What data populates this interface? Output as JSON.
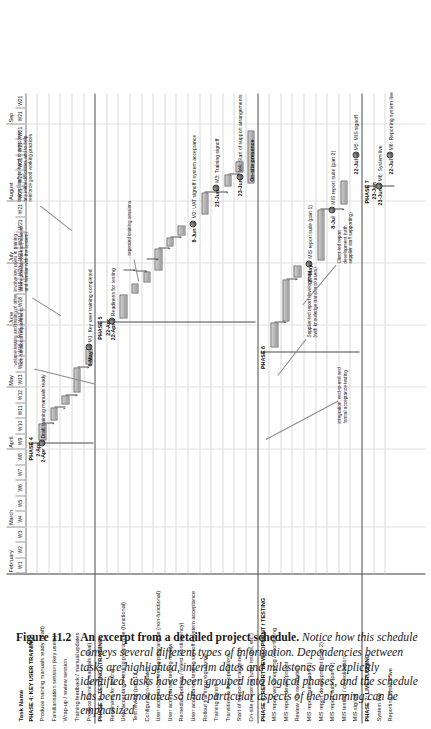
{
  "figure": {
    "number": "Figure 11.2",
    "title": "An excerpt from a detailed project schedule.",
    "body": "Notice how this schedule conveys several different types of information. Dependencies between tasks are highlighted, interim dates and milestones are explicitly identified, tasks have been grouped into logical phases, and the schedule has been annotated so that particular aspects of the planning can be emphasized"
  },
  "chart_data": {
    "type": "gantt",
    "title": "Detailed project schedule",
    "task_column_header": "Task Name",
    "months": [
      {
        "label": "February",
        "weeks": 3
      },
      {
        "label": "March",
        "weeks": 5
      },
      {
        "label": "April",
        "weeks": 4
      },
      {
        "label": "May",
        "weeks": 4
      },
      {
        "label": "June",
        "weeks": 4
      },
      {
        "label": "July",
        "weeks": 4
      },
      {
        "label": "August",
        "weeks": 5
      },
      {
        "label": "Sep",
        "weeks": 2
      }
    ],
    "weeks": [
      "W1",
      "W2",
      "W3",
      "W4",
      "W5",
      "W6",
      "W7",
      "W8",
      "W9",
      "W10",
      "W11",
      "W12",
      "W13",
      "W14",
      "W15",
      "W16",
      "W17",
      "W18",
      "W19",
      "W20",
      "W21",
      "W21",
      "W21",
      "W21",
      "W21",
      "W21",
      "W21",
      "W21",
      "W21",
      "W21",
      "W21"
    ],
    "rows": [
      {
        "name": "PHASE 4: KEY USER TRAINING",
        "kind": "phase"
      },
      {
        "name": "Produce training manuals ready (draft)",
        "kind": "task"
      },
      {
        "name": "Familiarisation session (key users)",
        "kind": "task"
      },
      {
        "name": "Wrap-up / review session",
        "kind": "task"
      },
      {
        "name": "Training feedback / manual updates",
        "kind": "task"
      },
      {
        "name": "Produce training manuals (final)",
        "kind": "task"
      },
      {
        "name": "PHASE 5: TESTING / TRAINING",
        "kind": "phase"
      },
      {
        "name": "Readiness for testing",
        "kind": "task"
      },
      {
        "name": "User acceptance testing programme (functional)",
        "kind": "task"
      },
      {
        "name": "Test review (part 1)",
        "kind": "task"
      },
      {
        "name": "Configuration updates",
        "kind": "task"
      },
      {
        "name": "User acceptance testing programme (non-functional)",
        "kind": "task"
      },
      {
        "name": "User acceptance testing review",
        "kind": "task"
      },
      {
        "name": "Remedial updates / retest (contingency)",
        "kind": "task"
      },
      {
        "name": "User acceptance testing signoff / system acceptance",
        "kind": "task"
      },
      {
        "name": "Rollout training programme",
        "kind": "task"
      },
      {
        "name": "Training signoff",
        "kind": "task"
      },
      {
        "name": "Transition to live operations",
        "kind": "task"
      },
      {
        "name": "Start of support arrangements",
        "kind": "task"
      },
      {
        "name": "On-site presence (user issues, etc.)",
        "kind": "task"
      },
      {
        "name": "PHASE 6: REPORT DEVELOPMENT / TESTING",
        "kind": "phase"
      },
      {
        "name": "MIS report workshopping / shortlisting",
        "kind": "task"
      },
      {
        "name": "MIS report development",
        "kind": "task"
      },
      {
        "name": "Review / consolidation",
        "kind": "task"
      },
      {
        "name": "MIS report suite (part 1)",
        "kind": "task"
      },
      {
        "name": "MIS report development (part 2)",
        "kind": "task"
      },
      {
        "name": "MIS report suite (part 2)",
        "kind": "task"
      },
      {
        "name": "MIS testing / consolidation",
        "kind": "task"
      },
      {
        "name": "MIS signoff",
        "kind": "task"
      },
      {
        "name": "PHASE 7: LIVE RUNNING",
        "kind": "phase"
      },
      {
        "name": "System live",
        "kind": "task"
      },
      {
        "name": "Reporting system live",
        "kind": "task"
      }
    ],
    "phase_labels": [
      {
        "text": "PHASE 4",
        "date": "2-Apr"
      },
      {
        "text": "PHASE 5",
        "date": "22-Apr"
      },
      {
        "text": "PHASE 6",
        "date": ""
      },
      {
        "text": "PHASE 7",
        "date": "23-Jun"
      }
    ],
    "milestones": [
      {
        "date": "2-Apr",
        "label": "Draft training manuals ready"
      },
      {
        "date": "6-May",
        "label": "M1: Key user training completed"
      },
      {
        "date": "22-Apr",
        "label": "Readiness for testing"
      },
      {
        "date": "8-Jun",
        "label": "M2: UAT signoff / system acceptance"
      },
      {
        "date": "21-Jun",
        "label": "M3: Training signoff"
      },
      {
        "date": "23-Jun",
        "label": "M4: Start of support arrangements"
      },
      {
        "date": "27-May",
        "label": "MIS report suite (part 1)"
      },
      {
        "date": "8-Jul",
        "label": "MIS report suite (part 2)"
      },
      {
        "date": "22-Jul",
        "label": "M5: MIS signoff"
      },
      {
        "date": "23-Jun",
        "label": "M6: System live"
      },
      {
        "date": "22-Jul",
        "label": "M6: Reporting system live"
      }
    ],
    "annotations": [
      "involve key users in training\nwhere possible (already trained\nand familiar with the system)",
      "volume testing and testing of other\nnon-functional requirements",
      "repeated training sessions",
      "integration, end-to-end and\nformal acceptance testing",
      "Supplier-led report development\n(with knowledge transfer to users)",
      "Client-led report\ndevelopment (with\nsupplier staff supporting)",
      "trained staff on-hand to overcome\nany initial difficulties and to help\nreinforce good working practices",
      "On-site presence"
    ]
  }
}
